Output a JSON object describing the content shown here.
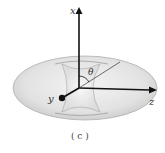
{
  "diagram": {
    "axes": {
      "x_label": "x",
      "y_label": "y",
      "z_label": "z"
    },
    "angle_label": "θ",
    "caption": "( c )",
    "colors": {
      "torus_fill": "#e4e4e4",
      "torus_edge": "#aaaaaa",
      "axis": "#111111"
    }
  }
}
